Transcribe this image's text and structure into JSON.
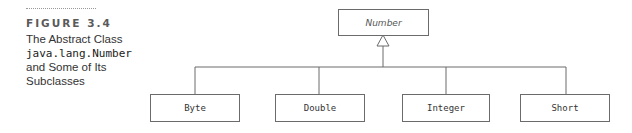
{
  "caption": {
    "figure_label": "FIGURE 3.4",
    "lines": [
      "The Abstract Class",
      "java.lang.Number",
      "and Some of Its",
      "Subclasses"
    ]
  },
  "diagram": {
    "superclass": {
      "name": "Number",
      "abstract": true
    },
    "subclasses": [
      {
        "name": "Byte"
      },
      {
        "name": "Double"
      },
      {
        "name": "Integer"
      },
      {
        "name": "Short"
      }
    ],
    "relationship": "inheritance"
  }
}
